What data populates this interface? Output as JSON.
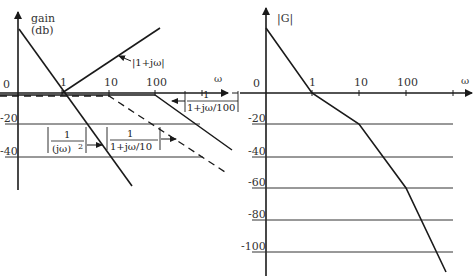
{
  "left_plot": {
    "y_axis_label_line1": "gain",
    "y_axis_label_line2": "(db)",
    "x_axis_label": "ω",
    "y_ticks": [
      "0",
      "-20",
      "-40"
    ],
    "x_ticks": [
      "1",
      "10",
      "100"
    ],
    "annotations": {
      "one_plus_jw": "|1+jω|",
      "inv_jw2_num": "1",
      "inv_jw2_den": "(jω)",
      "inv_jw2_exp": "2",
      "inv_10_num": "1",
      "inv_10_den": "1+jω/10",
      "inv_100_num": "1",
      "inv_100_den": "1+jω/100"
    }
  },
  "right_plot": {
    "y_axis_label": "|G|",
    "x_axis_label": "ω",
    "y_ticks": [
      "0",
      "-20",
      "-40",
      "-60",
      "-80",
      "-100"
    ],
    "x_ticks": [
      "1",
      "10",
      "100"
    ]
  },
  "colors": {
    "line": "#1a1a1a",
    "grid": "#333333",
    "text": "#333333"
  }
}
